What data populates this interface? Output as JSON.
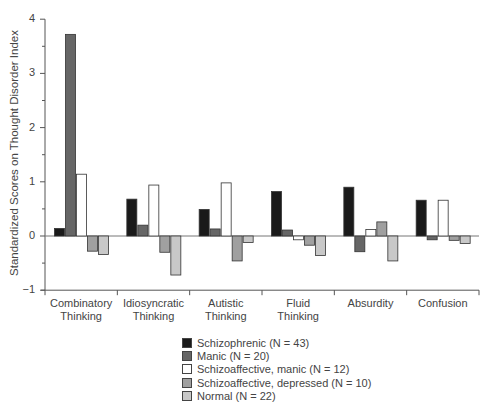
{
  "chart_data": {
    "type": "bar",
    "title": "",
    "xlabel": "",
    "ylabel": "Standardized Scores on Thought Disorder Index",
    "ylim": [
      -1,
      4
    ],
    "yticks": [
      -1,
      0,
      1,
      2,
      3,
      4
    ],
    "grid": false,
    "legend_position": "bottom-center",
    "categories": [
      "Combinatory Thinking",
      "Idiosyncratic Thinking",
      "Autistic Thinking",
      "Fluid Thinking",
      "Absurdity",
      "Confusion"
    ],
    "category_lines": [
      [
        "Combinatory",
        "Thinking"
      ],
      [
        "Idiosyncratic",
        "Thinking"
      ],
      [
        "Autistic",
        "Thinking"
      ],
      [
        "Fluid",
        "Thinking"
      ],
      [
        "Absurdity"
      ],
      [
        "Confusion"
      ]
    ],
    "series": [
      {
        "name": "Schizophrenic (N = 43)",
        "color": "#1a1a1a",
        "values": [
          0.14,
          0.68,
          0.49,
          0.82,
          0.9,
          0.66
        ]
      },
      {
        "name": "Manic (N = 20)",
        "color": "#666666",
        "values": [
          3.72,
          0.2,
          0.13,
          0.11,
          -0.29,
          -0.07
        ]
      },
      {
        "name": "Schizoaffective, manic (N = 12)",
        "color": "#ffffff",
        "values": [
          1.14,
          0.94,
          0.98,
          -0.07,
          0.12,
          0.66
        ]
      },
      {
        "name": "Schizoaffective, depressed (N = 10)",
        "color": "#a0a0a0",
        "values": [
          -0.28,
          -0.3,
          -0.46,
          -0.17,
          0.26,
          -0.08
        ]
      },
      {
        "name": "Normal (N = 22)",
        "color": "#c8c8c8",
        "values": [
          -0.34,
          -0.72,
          -0.12,
          -0.36,
          -0.46,
          -0.14
        ]
      }
    ]
  }
}
